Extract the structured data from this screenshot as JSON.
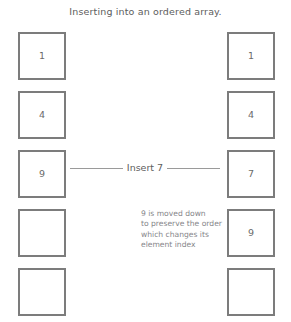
{
  "title": "Inserting into an ordered array.",
  "insert": {
    "label": "Insert 7"
  },
  "columns": {
    "before": {
      "name": "original-array",
      "cells": [
        {
          "value": "1"
        },
        {
          "value": "4"
        },
        {
          "value": "9"
        },
        {
          "value": ""
        },
        {
          "value": ""
        }
      ]
    },
    "after": {
      "name": "resulting-array",
      "cells": [
        {
          "value": "1"
        },
        {
          "value": "4"
        },
        {
          "value": "7"
        },
        {
          "value": "9"
        },
        {
          "value": ""
        }
      ]
    }
  },
  "annotation": {
    "line1": "9 is moved down",
    "line2": "to preserve the order",
    "line3": "which changes its",
    "line4": "element index"
  },
  "colors": {
    "box_border": "#7c7c7c",
    "title_text": "#5d5d5d",
    "cell_text": "#6a6a6a",
    "annotation_text": "#86868a",
    "divider_line": "#9a9a9a",
    "background": "#ffffff"
  }
}
